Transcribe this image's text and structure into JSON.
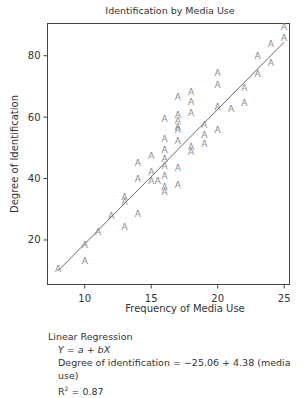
{
  "chart_data": {
    "type": "scatter",
    "title": "Identification by Media Use",
    "xlabel": "Frequency of Media Use",
    "ylabel": "Degree of Identification",
    "xlim": [
      7.2,
      25.4
    ],
    "ylim": [
      5.5,
      90.5
    ],
    "xticks": [
      10,
      15,
      20,
      25
    ],
    "yticks": [
      20,
      40,
      60,
      80
    ],
    "grid": false,
    "legend": null,
    "marker_glyph": "A",
    "marker_color": "#8a8a8a",
    "line_color": "#6a6a6a",
    "points": [
      [
        8,
        10.6
      ],
      [
        10,
        18.4
      ],
      [
        10,
        13.2
      ],
      [
        11,
        22.9
      ],
      [
        12,
        28.1
      ],
      [
        13,
        24.5
      ],
      [
        13,
        34.2
      ],
      [
        13,
        32.6
      ],
      [
        14,
        28.7
      ],
      [
        14,
        45.2
      ],
      [
        14,
        40.0
      ],
      [
        15,
        47.4
      ],
      [
        15,
        42.3
      ],
      [
        15,
        39.4
      ],
      [
        15.5,
        39.4
      ],
      [
        16,
        59.4
      ],
      [
        16,
        53.2
      ],
      [
        16,
        49.4
      ],
      [
        16,
        46.5
      ],
      [
        16,
        44.2
      ],
      [
        16,
        41.0
      ],
      [
        16,
        37.4
      ],
      [
        16,
        35.8
      ],
      [
        17,
        66.8
      ],
      [
        17,
        61.0
      ],
      [
        17,
        59.0
      ],
      [
        17,
        57.1
      ],
      [
        17,
        56.1
      ],
      [
        17,
        52.3
      ],
      [
        17,
        43.5
      ],
      [
        17,
        38.1
      ],
      [
        18,
        68.4
      ],
      [
        18,
        65.2
      ],
      [
        18,
        61.6
      ],
      [
        18,
        50.3
      ],
      [
        18,
        48.7
      ],
      [
        19,
        57.7
      ],
      [
        19,
        54.5
      ],
      [
        19,
        51.3
      ],
      [
        20,
        74.5
      ],
      [
        20,
        70.6
      ],
      [
        20,
        63.5
      ],
      [
        20,
        56.1
      ],
      [
        21,
        62.9
      ],
      [
        22,
        69.7
      ],
      [
        22,
        64.8
      ],
      [
        23,
        80.0
      ],
      [
        23,
        74.2
      ],
      [
        24,
        83.9
      ],
      [
        24,
        77.7
      ],
      [
        25,
        89.4
      ],
      [
        25,
        86.1
      ]
    ],
    "regression": {
      "intercept": -25.06,
      "slope": 4.38,
      "x_range": [
        8,
        25
      ],
      "r_squared": 0.87
    }
  },
  "caption": {
    "heading": "Linear Regression",
    "model": "Y = a + bX",
    "equation": "Degree of identification = −25.06 + 4.38 (media use)",
    "r2_prefix": "R",
    "r2_sup": "2",
    "r2_value": " = 0.87"
  }
}
